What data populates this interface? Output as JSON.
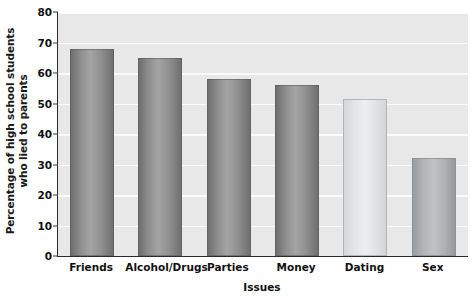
{
  "chart_data": {
    "type": "bar",
    "title": "",
    "categories": [
      "Friends",
      "Alcohol/Drugs",
      "Parties",
      "Money",
      "Dating",
      "Sex"
    ],
    "values": [
      68,
      65,
      58,
      56,
      51.5,
      32
    ],
    "xlabel": "Issues",
    "ylabel_line1": "Percentage of high school students",
    "ylabel_line2": "who lied to parents",
    "ylim": [
      0,
      80
    ],
    "ytick_labels": [
      "0",
      "10",
      "20",
      "30",
      "40",
      "50",
      "60",
      "70",
      "80"
    ],
    "ytick_values": [
      0,
      10,
      20,
      30,
      40,
      50,
      60,
      70,
      80
    ],
    "grid": true,
    "legend": "none",
    "bar_shades": [
      "dark",
      "dark",
      "dark",
      "dark",
      "light",
      "mid"
    ],
    "colors": {
      "plot_background": "#e8e8e8",
      "gridline": "#fbfbfb",
      "axis": "#2b2b2b",
      "bar_dark": "#8d8d8d",
      "bar_light": "#e3e5e6",
      "bar_mid": "#b2b4b5",
      "text": "#111111"
    }
  }
}
